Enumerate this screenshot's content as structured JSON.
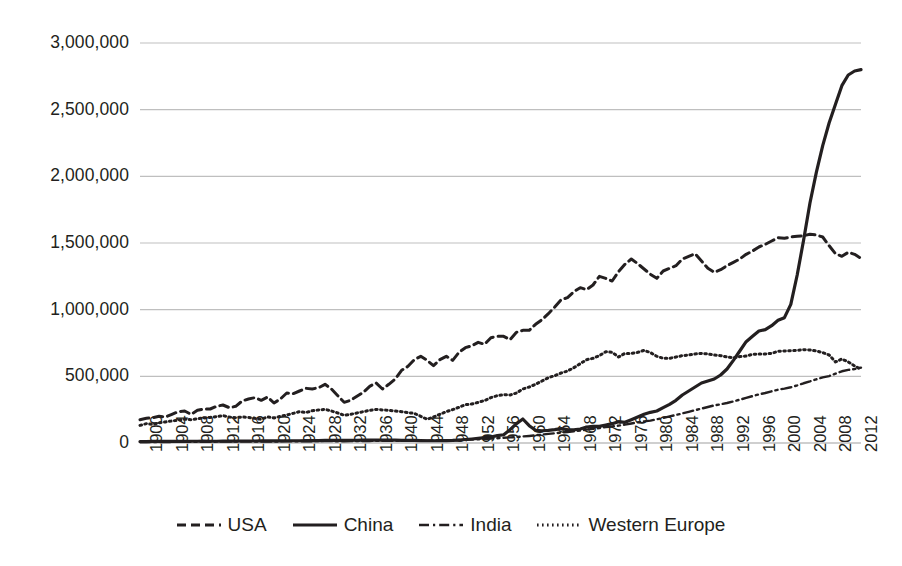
{
  "chart_data": {
    "type": "line",
    "title": "",
    "subtitle": "",
    "xlabel": "",
    "ylabel": "",
    "xlim": [
      1900,
      2013
    ],
    "ylim": [
      0,
      3000000
    ],
    "grid": true,
    "grid_axis": "y",
    "legend_position": "bottom",
    "y_ticks": [
      0,
      500000,
      1000000,
      1500000,
      2000000,
      2500000,
      3000000
    ],
    "y_tick_labels": [
      "0",
      "500,000",
      "1,000,000",
      "1,500,000",
      "2,000,000",
      "2,500,000",
      "3,000,000"
    ],
    "x_ticks": [
      1900,
      1904,
      1908,
      1912,
      1916,
      1920,
      1924,
      1928,
      1932,
      1936,
      1940,
      1944,
      1948,
      1952,
      1956,
      1960,
      1964,
      1968,
      1972,
      1976,
      1980,
      1984,
      1988,
      1992,
      1996,
      2000,
      2004,
      2008,
      2012
    ],
    "x_tick_labels": [
      "1900",
      "1904",
      "1908",
      "1912",
      "1916",
      "1920",
      "1924",
      "1928",
      "1932",
      "1936",
      "1940",
      "1944",
      "1948",
      "1952",
      "1956",
      "1960",
      "1964",
      "1968",
      "1972",
      "1976",
      "1980",
      "1984",
      "1988",
      "1992",
      "1996",
      "2000",
      "2004",
      "2008",
      "2012"
    ],
    "x": [
      1900,
      1901,
      1902,
      1903,
      1904,
      1905,
      1906,
      1907,
      1908,
      1909,
      1910,
      1911,
      1912,
      1913,
      1914,
      1915,
      1916,
      1917,
      1918,
      1919,
      1920,
      1921,
      1922,
      1923,
      1924,
      1925,
      1926,
      1927,
      1928,
      1929,
      1930,
      1931,
      1932,
      1933,
      1934,
      1935,
      1936,
      1937,
      1938,
      1939,
      1940,
      1941,
      1942,
      1943,
      1944,
      1945,
      1946,
      1947,
      1948,
      1949,
      1950,
      1951,
      1952,
      1953,
      1954,
      1955,
      1956,
      1957,
      1958,
      1959,
      1960,
      1961,
      1962,
      1963,
      1964,
      1965,
      1966,
      1967,
      1968,
      1969,
      1970,
      1971,
      1972,
      1973,
      1974,
      1975,
      1976,
      1977,
      1978,
      1979,
      1980,
      1981,
      1982,
      1983,
      1984,
      1985,
      1986,
      1987,
      1988,
      1989,
      1990,
      1991,
      1992,
      1993,
      1994,
      1995,
      1996,
      1997,
      1998,
      1999,
      2000,
      2001,
      2002,
      2003,
      2004,
      2005,
      2006,
      2007,
      2008,
      2009,
      2010,
      2011,
      2012,
      2013
    ],
    "series": [
      {
        "name": "USA",
        "line_style": "dashed",
        "color": "#231f20",
        "values": [
          175000,
          185000,
          190000,
          200000,
          195000,
          215000,
          235000,
          240000,
          215000,
          245000,
          255000,
          255000,
          275000,
          285000,
          265000,
          275000,
          315000,
          330000,
          340000,
          320000,
          345000,
          300000,
          330000,
          375000,
          370000,
          390000,
          410000,
          405000,
          415000,
          440000,
          405000,
          355000,
          305000,
          320000,
          350000,
          380000,
          425000,
          450000,
          405000,
          440000,
          480000,
          545000,
          575000,
          625000,
          650000,
          620000,
          580000,
          625000,
          650000,
          620000,
          680000,
          715000,
          730000,
          755000,
          740000,
          790000,
          800000,
          800000,
          775000,
          830000,
          845000,
          845000,
          890000,
          925000,
          970000,
          1020000,
          1075000,
          1090000,
          1135000,
          1165000,
          1150000,
          1185000,
          1250000,
          1235000,
          1215000,
          1285000,
          1340000,
          1380000,
          1345000,
          1305000,
          1265000,
          1235000,
          1290000,
          1310000,
          1330000,
          1380000,
          1400000,
          1420000,
          1365000,
          1310000,
          1280000,
          1300000,
          1330000,
          1355000,
          1380000,
          1415000,
          1440000,
          1470000,
          1490000,
          1515000,
          1540000,
          1535000,
          1545000,
          1550000,
          1555000,
          1565000,
          1560000,
          1545000,
          1480000,
          1420000,
          1400000,
          1430000,
          1415000,
          1385000
        ]
      },
      {
        "name": "China",
        "line_style": "solid",
        "color": "#231f20",
        "values": [
          11000,
          11000,
          11500,
          11500,
          12000,
          12000,
          12500,
          12500,
          13000,
          13000,
          13500,
          13000,
          13000,
          14000,
          14000,
          14500,
          15000,
          15000,
          15000,
          15500,
          16000,
          16000,
          16500,
          17000,
          17000,
          17000,
          17500,
          18000,
          18500,
          19000,
          19500,
          20000,
          20000,
          20000,
          20500,
          21000,
          22000,
          22000,
          21000,
          21000,
          21000,
          20000,
          19500,
          19000,
          18500,
          17000,
          17000,
          17500,
          18000,
          19000,
          22000,
          26000,
          30000,
          35000,
          40000,
          45000,
          55000,
          62000,
          100000,
          145000,
          180000,
          130000,
          95000,
          92000,
          95000,
          100000,
          108000,
          100000,
          98000,
          105000,
          120000,
          125000,
          125000,
          135000,
          145000,
          160000,
          155000,
          175000,
          195000,
          215000,
          230000,
          240000,
          265000,
          290000,
          320000,
          360000,
          390000,
          420000,
          450000,
          465000,
          480000,
          510000,
          555000,
          620000,
          690000,
          760000,
          800000,
          840000,
          850000,
          880000,
          920000,
          940000,
          1040000,
          1260000,
          1520000,
          1800000,
          2030000,
          2230000,
          2400000,
          2540000,
          2680000,
          2760000,
          2790000,
          2800000
        ]
      },
      {
        "name": "India",
        "line_style": "dashdot",
        "color": "#231f20",
        "values": [
          7000,
          7000,
          7500,
          7500,
          8000,
          8000,
          8500,
          8500,
          9000,
          9000,
          9500,
          9500,
          10000,
          10000,
          10000,
          10500,
          11000,
          11000,
          11000,
          11000,
          11500,
          11500,
          12000,
          12500,
          12500,
          13000,
          13000,
          13500,
          14000,
          14000,
          14000,
          13500,
          13500,
          14000,
          14500,
          15000,
          15500,
          16000,
          16000,
          16500,
          17000,
          17500,
          17500,
          17500,
          18000,
          18000,
          18500,
          19000,
          20000,
          21000,
          22000,
          24000,
          26000,
          28000,
          30000,
          33000,
          36000,
          39000,
          42000,
          45000,
          49000,
          53000,
          58000,
          63000,
          68000,
          73000,
          78000,
          82000,
          87000,
          93000,
          100000,
          106000,
          112000,
          119000,
          124000,
          130000,
          138000,
          146000,
          155000,
          162000,
          168000,
          178000,
          188000,
          200000,
          210000,
          222000,
          234000,
          246000,
          258000,
          270000,
          282000,
          290000,
          300000,
          312000,
          325000,
          338000,
          352000,
          365000,
          375000,
          388000,
          400000,
          408000,
          418000,
          432000,
          448000,
          462000,
          478000,
          492000,
          502000,
          520000,
          538000,
          548000,
          555000,
          565000
        ]
      },
      {
        "name": "Western Europe",
        "line_style": "dotted",
        "color": "#231f20",
        "values": [
          132000,
          145000,
          140000,
          152000,
          158000,
          165000,
          172000,
          178000,
          175000,
          182000,
          188000,
          192000,
          198000,
          205000,
          195000,
          190000,
          195000,
          192000,
          185000,
          178000,
          195000,
          188000,
          200000,
          210000,
          222000,
          235000,
          228000,
          242000,
          248000,
          252000,
          240000,
          225000,
          208000,
          215000,
          225000,
          235000,
          245000,
          252000,
          248000,
          245000,
          240000,
          235000,
          228000,
          222000,
          200000,
          178000,
          195000,
          215000,
          235000,
          250000,
          268000,
          288000,
          292000,
          305000,
          318000,
          340000,
          355000,
          362000,
          360000,
          375000,
          405000,
          420000,
          440000,
          465000,
          490000,
          505000,
          525000,
          540000,
          565000,
          595000,
          625000,
          635000,
          655000,
          685000,
          680000,
          645000,
          672000,
          672000,
          680000,
          695000,
          678000,
          650000,
          635000,
          635000,
          645000,
          655000,
          660000,
          668000,
          672000,
          668000,
          660000,
          655000,
          645000,
          640000,
          648000,
          652000,
          665000,
          668000,
          668000,
          672000,
          688000,
          690000,
          692000,
          695000,
          700000,
          698000,
          690000,
          678000,
          660000,
          608000,
          630000,
          608000,
          578000,
          552000
        ]
      }
    ]
  },
  "legend": {
    "items": [
      {
        "label": "USA",
        "style": "dashed"
      },
      {
        "label": "China",
        "style": "solid"
      },
      {
        "label": "India",
        "style": "dashdot"
      },
      {
        "label": "Western Europe",
        "style": "dotted"
      }
    ]
  },
  "colors": {
    "line": "#231f20",
    "grid": "#bfbfbf",
    "background": "#ffffff"
  }
}
